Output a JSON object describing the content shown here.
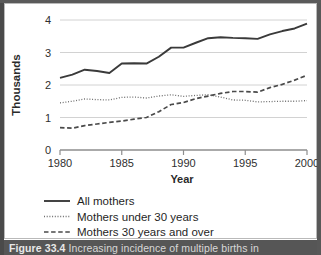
{
  "figure": {
    "caption_number": "Figure 33.4",
    "caption_text": "Increasing incidence of multiple births in"
  },
  "chart_data": {
    "type": "line",
    "title": "",
    "xlabel": "Year",
    "ylabel": "Thousands",
    "xlim": [
      1980,
      2000
    ],
    "ylim": [
      0,
      4
    ],
    "xticks": [
      1980,
      1985,
      1990,
      1995,
      2000
    ],
    "xtick_labels": [
      "1980",
      "1985",
      "1990",
      "1995",
      "2000"
    ],
    "yticks": [
      0,
      1,
      2,
      3,
      4
    ],
    "ytick_labels": [
      "0",
      "1",
      "2",
      "3",
      "4"
    ],
    "grid": "horizontal",
    "legend_position": "below",
    "x": [
      1980,
      1981,
      1982,
      1983,
      1984,
      1985,
      1986,
      1987,
      1988,
      1989,
      1990,
      1991,
      1992,
      1993,
      1994,
      1995,
      1996,
      1997,
      1998,
      1999,
      2000
    ],
    "series": [
      {
        "name": "All mothers",
        "style": "solid",
        "color": "#3a3a3a",
        "values": [
          2.22,
          2.32,
          2.47,
          2.43,
          2.37,
          2.66,
          2.67,
          2.66,
          2.87,
          3.15,
          3.15,
          3.3,
          3.44,
          3.47,
          3.45,
          3.44,
          3.42,
          3.56,
          3.66,
          3.74,
          3.89
        ]
      },
      {
        "name": "Mothers under 30 years",
        "style": "dotted",
        "color": "#6e6e6e",
        "values": [
          1.45,
          1.5,
          1.57,
          1.55,
          1.54,
          1.62,
          1.63,
          1.6,
          1.66,
          1.7,
          1.65,
          1.68,
          1.7,
          1.63,
          1.54,
          1.53,
          1.48,
          1.49,
          1.5,
          1.5,
          1.52
        ]
      },
      {
        "name": "Mothers 30 years and over",
        "style": "dashed",
        "color": "#4a4a4a",
        "values": [
          0.69,
          0.67,
          0.75,
          0.8,
          0.85,
          0.89,
          0.95,
          1.0,
          1.18,
          1.4,
          1.46,
          1.58,
          1.66,
          1.74,
          1.8,
          1.8,
          1.78,
          1.92,
          2.02,
          2.15,
          2.3
        ]
      }
    ]
  },
  "legend": {
    "items": [
      {
        "label": "All mothers"
      },
      {
        "label": "Mothers under 30 years"
      },
      {
        "label": "Mothers 30 years and over"
      }
    ]
  }
}
